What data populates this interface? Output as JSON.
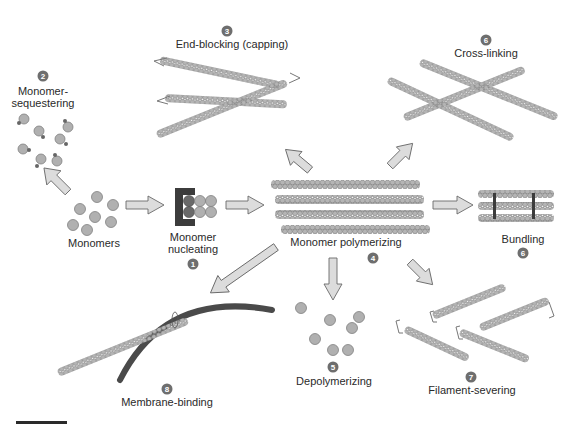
{
  "figure": {
    "type": "diagram",
    "colors": {
      "monomer": "#b0b0b0",
      "monomer_stroke": "#808080",
      "arrow_fill": "#dcdcdc",
      "arrow_stroke": "#6a6a6a",
      "membrane": "#4a4a4a",
      "nucleator": "#3c3c3c",
      "number_badge": "#6e6e6e"
    }
  },
  "steps": [
    {
      "number": "1",
      "label_line1": "Monomer",
      "label_line2": "nucleating"
    },
    {
      "number": "2",
      "label_line1": "Monomer-",
      "label_line2": "sequestering"
    },
    {
      "number": "3",
      "label": "End-blocking (capping)"
    },
    {
      "number": "4",
      "label": "Monomer polymerizing"
    },
    {
      "number": "5",
      "label": "Depolymerizing"
    },
    {
      "number": "6",
      "label": "Cross-linking"
    },
    {
      "number": "6",
      "label": "Bundling"
    },
    {
      "number": "7",
      "label": "Filament-severing"
    },
    {
      "number": "8",
      "label": "Membrane-binding"
    }
  ],
  "monomers_label": "Monomers",
  "scale_bar": {
    "present": true
  }
}
